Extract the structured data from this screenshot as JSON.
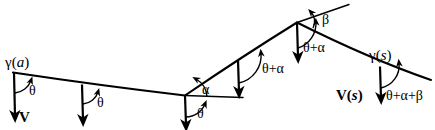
{
  "figure": {
    "type": "geometry-diagram",
    "stroke_color": "#000000",
    "background_color": "#ffffff",
    "width": 435,
    "height": 130
  },
  "labels": {
    "gamma_a": "γ(a)",
    "gamma_s": "γ(s)",
    "vector_v": "V",
    "vector_v_s": "V(s)",
    "theta_1": "θ",
    "theta_2": "θ",
    "theta_3": "θ",
    "alpha": "α",
    "theta_plus_alpha_1": "θ+α",
    "theta_plus_alpha_2": "θ+α",
    "beta": "β",
    "theta_plus_alpha_plus_beta": "θ+α+β"
  },
  "curve": {
    "start_point_label": "γ(a)",
    "end_point_label": "γ(s)",
    "corner_angle_label": "α",
    "peak_angle_label": "β"
  },
  "vectors": [
    {
      "name": "V at gamma(a)",
      "label": "V",
      "angle_label": "θ"
    },
    {
      "name": "V second",
      "label": "",
      "angle_label": "θ"
    },
    {
      "name": "V at corner",
      "label": "",
      "angle_label": "θ"
    },
    {
      "name": "V on rise",
      "label": "",
      "angle_label": "θ+α"
    },
    {
      "name": "V at peak",
      "label": "",
      "angle_label": "θ+α"
    },
    {
      "name": "V at gamma(s)",
      "label": "V(s)",
      "angle_label": "θ+α+β"
    }
  ]
}
